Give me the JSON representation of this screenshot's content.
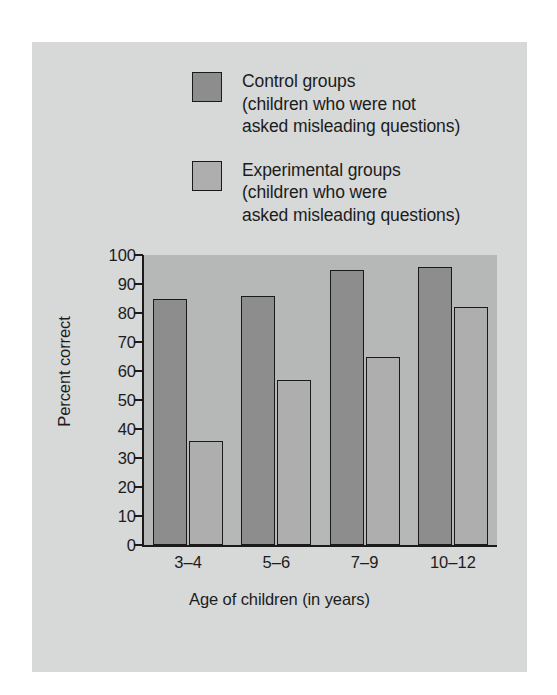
{
  "legend": {
    "entries": [
      {
        "swatch": "control-swatch",
        "lines": [
          "Control groups",
          "(children who were not",
          "asked misleading questions)"
        ]
      },
      {
        "swatch": "experimental-swatch",
        "lines": [
          "Experimental groups",
          "(children who were",
          "asked misleading questions)"
        ]
      }
    ]
  },
  "colors": {
    "figure_background": "#d7d8d8",
    "plot_background": "#b6b7b7",
    "control_bar": "#8d8d8d",
    "experimental_bar": "#aeaeae",
    "axis": "#1a1a1a",
    "text": "#1c1c1c"
  },
  "chart_data": {
    "type": "bar",
    "title": "",
    "xlabel": "Age of children (in years)",
    "ylabel": "Percent correct",
    "categories": [
      "3–4",
      "5–6",
      "7–9",
      "10–12"
    ],
    "series": [
      {
        "name": "Control groups",
        "values": [
          85,
          86,
          95,
          96
        ]
      },
      {
        "name": "Experimental groups",
        "values": [
          36,
          57,
          65,
          82
        ]
      }
    ],
    "ylim": [
      0,
      100
    ],
    "ytick_values": [
      0,
      10,
      20,
      30,
      40,
      50,
      60,
      70,
      80,
      90,
      100
    ],
    "ytick_labels": [
      "0",
      "10",
      "20",
      "30",
      "40",
      "50",
      "60",
      "70",
      "80",
      "90",
      "100"
    ],
    "grid": false,
    "legend_position": "above-plot"
  }
}
